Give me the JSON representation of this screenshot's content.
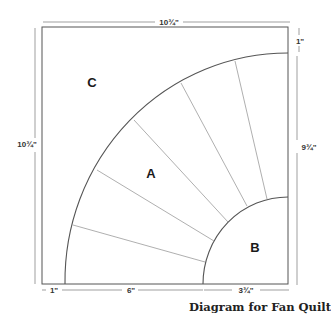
{
  "caption": "Diagram for Fan Quilt",
  "regions": {
    "a": "A",
    "b": "B",
    "c": "C"
  },
  "dimensions": {
    "top_width": "10¾\"",
    "left_height": "10¾\"",
    "right_height": "9¾\"",
    "top_right_gap": "1\"",
    "bottom_left": "1\"",
    "bottom_middle": "6\"",
    "bottom_right": "3¾\""
  },
  "colors": {
    "outline": "#555555",
    "blade_lines": "#9a9a9a",
    "text": "#222222"
  }
}
